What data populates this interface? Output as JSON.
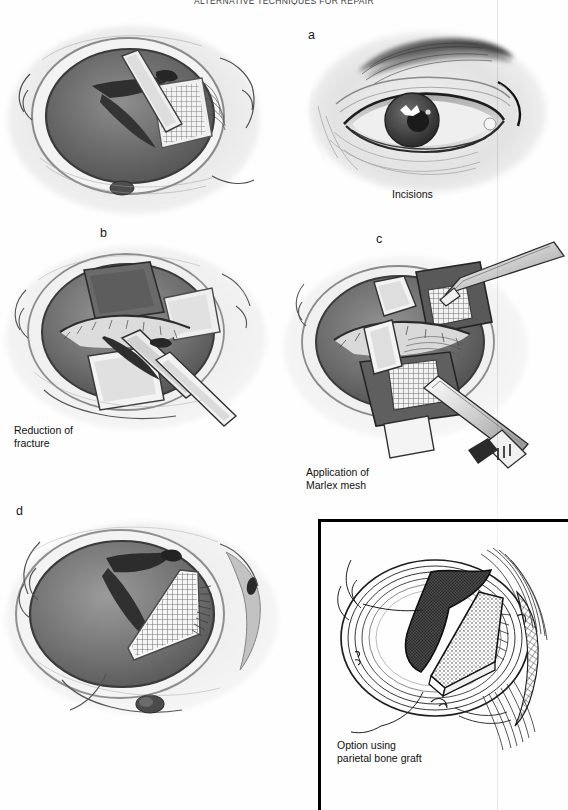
{
  "page": {
    "width": 568,
    "height": 810,
    "running_head": "ALTERNATIVE TECHNIQUES FOR REPAIR",
    "background": "#ffffff"
  },
  "figure": {
    "type": "medical-illustration-plate",
    "panel_count": 5
  },
  "panels": [
    {
      "id": "a",
      "letter": "a",
      "caption": "Incisions",
      "description": "Frontal view of eye and periorbital region with subciliary and lateral canthal incision lines marked",
      "style": "airbrush-halftone"
    },
    {
      "id": "b",
      "letter": "b",
      "caption": "Reduction of\nfracture",
      "description": "Surgical exposure of orbital rim and floor with retractors and elevator reducing the fracture",
      "style": "airbrush-halftone"
    },
    {
      "id": "c",
      "letter": "c",
      "caption": "Application of\nMarlex mesh",
      "description": "Marlex mesh sheets being positioned with forceps into the orbital defect",
      "style": "airbrush-halftone"
    },
    {
      "id": "d",
      "letter": "d",
      "caption": "",
      "description": "Orbital floor viewed from above with Marlex mesh implant seated over the defect",
      "style": "airbrush-halftone"
    },
    {
      "id": "e",
      "letter": "e",
      "caption": "Option using\nparietal bone graft",
      "description": "Line drawing inset of orbital floor with split-thickness parietal bone graft in place",
      "style": "line-art",
      "boxed": true
    }
  ],
  "colors": {
    "ink": "#1a1a1a",
    "caption": "#111111",
    "paper": "#ffffff",
    "wash_dark": "#4a4a4a",
    "wash_mid": "#8d8d8d",
    "wash_light": "#c9c9c9",
    "seam": "rgba(0,0,0,0.10)"
  }
}
